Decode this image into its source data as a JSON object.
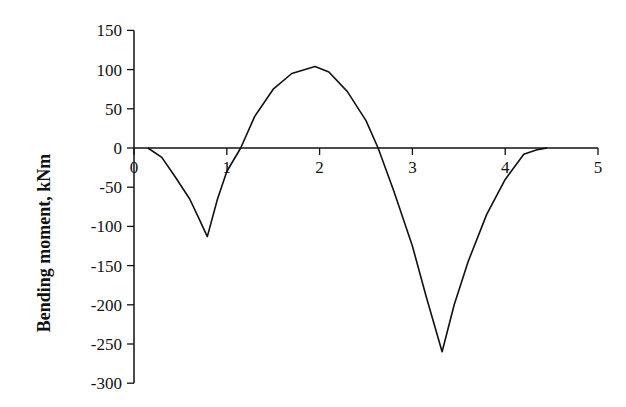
{
  "chart_data": {
    "type": "line",
    "title": "",
    "xlabel": "",
    "ylabel": "Bending moment, kNm",
    "xlim": [
      0,
      5
    ],
    "ylim": [
      -300,
      150
    ],
    "x_ticks": [
      0,
      1,
      2,
      3,
      4,
      5
    ],
    "x_tick_labels": [
      "0",
      "1",
      "2",
      "3",
      "4",
      "5"
    ],
    "y_ticks": [
      150,
      100,
      50,
      0,
      -50,
      -100,
      -150,
      -200,
      -250,
      -300
    ],
    "y_tick_labels": [
      "150",
      "100",
      "50",
      "0",
      "-50",
      "-100",
      "-150",
      "-200",
      "-250",
      "-300"
    ],
    "grid": false,
    "legend": null,
    "series": [
      {
        "name": "Bending moment",
        "color": "#111111",
        "x": [
          0.15,
          0.3,
          0.45,
          0.6,
          0.7,
          0.79,
          0.9,
          1.0,
          1.15,
          1.3,
          1.5,
          1.7,
          1.95,
          2.1,
          2.3,
          2.5,
          2.63,
          2.8,
          3.0,
          3.15,
          3.32,
          3.45,
          3.6,
          3.8,
          4.0,
          4.2,
          4.35,
          4.45
        ],
        "y": [
          0,
          -12,
          -38,
          -65,
          -90,
          -113,
          -65,
          -30,
          0,
          40,
          75,
          95,
          104,
          97,
          72,
          35,
          0,
          -55,
          -125,
          -190,
          -260,
          -200,
          -145,
          -85,
          -40,
          -8,
          -2,
          0
        ]
      }
    ]
  },
  "axes": {
    "ylabel": "Bending moment, kNm",
    "x_tick_labels": [
      "0",
      "1",
      "2",
      "3",
      "4",
      "5"
    ],
    "y_tick_labels": [
      "150",
      "100",
      "50",
      "0",
      "-50",
      "-100",
      "-150",
      "-200",
      "-250",
      "-300"
    ]
  }
}
